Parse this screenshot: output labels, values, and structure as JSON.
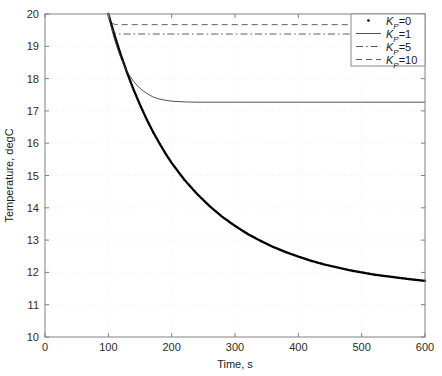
{
  "chart_data": {
    "type": "line",
    "title": "",
    "xlabel": "Time, s",
    "ylabel": "Temperature, degC",
    "xlim": [
      0,
      600
    ],
    "ylim": [
      10,
      20
    ],
    "xticks": [
      0,
      100,
      200,
      300,
      400,
      500,
      600
    ],
    "yticks": [
      10,
      11,
      12,
      13,
      14,
      15,
      16,
      17,
      18,
      19,
      20
    ],
    "grid": true,
    "grid_style": "dotted",
    "legend_position": "top-right",
    "series": [
      {
        "name": "Kp=0",
        "legend_label_base": "K",
        "legend_label_sub": "P",
        "legend_label_tail": "=0",
        "style": "dotted",
        "color": "#000000",
        "width": 2.4,
        "x": [
          100,
          110,
          120,
          130,
          140,
          150,
          160,
          170,
          180,
          190,
          200,
          220,
          240,
          260,
          280,
          300,
          320,
          340,
          360,
          380,
          400,
          420,
          440,
          460,
          480,
          500,
          520,
          540,
          560,
          580,
          600
        ],
        "y": [
          20.0,
          19.33,
          18.72,
          18.16,
          17.65,
          17.19,
          16.76,
          16.37,
          16.02,
          15.69,
          15.39,
          14.87,
          14.43,
          14.05,
          13.72,
          13.44,
          13.19,
          12.98,
          12.79,
          12.63,
          12.49,
          12.36,
          12.25,
          12.16,
          12.07,
          12.0,
          11.93,
          11.88,
          11.83,
          11.78,
          11.74
        ]
      },
      {
        "name": "Kp=1",
        "legend_label_base": "K",
        "legend_label_sub": "P",
        "legend_label_tail": "=1",
        "style": "solid",
        "color": "#3d3d3d",
        "width": 0.9,
        "x": [
          100,
          105,
          110,
          115,
          120,
          125,
          130,
          135,
          140,
          145,
          150,
          155,
          160,
          165,
          170,
          175,
          180,
          190,
          200,
          220,
          240,
          260,
          300,
          350,
          400,
          450,
          500,
          550,
          600
        ],
        "y": [
          20.0,
          19.56,
          19.2,
          18.89,
          18.63,
          18.4,
          18.21,
          18.05,
          17.91,
          17.8,
          17.7,
          17.62,
          17.55,
          17.49,
          17.44,
          17.4,
          17.37,
          17.33,
          17.3,
          17.28,
          17.27,
          17.27,
          17.27,
          17.27,
          17.27,
          17.27,
          17.27,
          17.27,
          17.27
        ]
      },
      {
        "name": "Kp=5",
        "legend_label_base": "K",
        "legend_label_sub": "P",
        "legend_label_tail": "=5",
        "style": "dashdot",
        "color": "#4a4a4a",
        "width": 0.9,
        "x": [
          100,
          104,
          108,
          112,
          120,
          140,
          200,
          300,
          400,
          500,
          600
        ],
        "y": [
          20.0,
          19.62,
          19.46,
          19.4,
          19.38,
          19.38,
          19.38,
          19.38,
          19.38,
          19.38,
          19.38
        ]
      },
      {
        "name": "Kp=10",
        "legend_label_base": "K",
        "legend_label_sub": "P",
        "legend_label_tail": "=10",
        "style": "dashed",
        "color": "#4a4a4a",
        "width": 0.9,
        "x": [
          100,
          103,
          106,
          110,
          120,
          140,
          200,
          300,
          400,
          500,
          600
        ],
        "y": [
          20.0,
          19.79,
          19.71,
          19.68,
          19.67,
          19.67,
          19.67,
          19.67,
          19.67,
          19.67,
          19.67
        ]
      }
    ],
    "axis_color": "#808080",
    "grid_color": "#e8e8f0",
    "background": "#ffffff",
    "plot_rect": {
      "left": 45,
      "top": 14,
      "right": 425,
      "bottom": 337
    }
  },
  "legend": {
    "box": {
      "left": 351,
      "top": 14,
      "width": 74,
      "height": 52
    },
    "entries": [
      {
        "label": "Kp=0",
        "marker": "dot"
      },
      {
        "label": "Kp=1",
        "marker": "solid-line"
      },
      {
        "label": "Kp=5",
        "marker": "dashdot-line"
      },
      {
        "label": "Kp=10",
        "marker": "dashed-line"
      }
    ]
  }
}
